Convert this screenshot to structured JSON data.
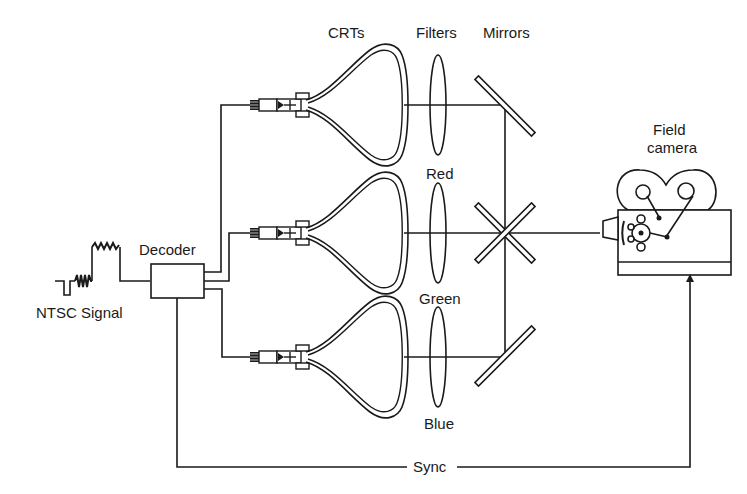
{
  "diagram": {
    "labels": {
      "crts": "CRTs",
      "filters": "Filters",
      "mirrors": "Mirrors",
      "field_camera_line1": "Field",
      "field_camera_line2": "camera",
      "red": "Red",
      "green": "Green",
      "blue": "Blue",
      "decoder": "Decoder",
      "ntsc_signal": "NTSC Signal",
      "sync": "Sync"
    },
    "colors": {
      "line": "#1a1a1a",
      "background": "#ffffff"
    }
  }
}
